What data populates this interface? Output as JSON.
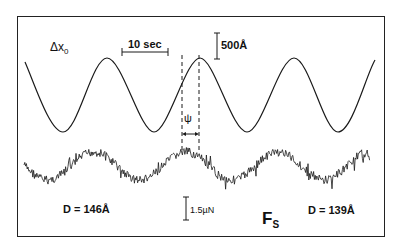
{
  "figure": {
    "top_trace_label": "Δx",
    "top_trace_label_sub": "0",
    "time_scale_label": "10 sec",
    "displacement_scale_label": "500Å",
    "phase_label": "ψ",
    "force_scale_label": "1.5µN",
    "bottom_trace_label": "F",
    "bottom_trace_label_sub": "S",
    "left_distance_label": "D = 146Å",
    "right_distance_label": "D = 139Å"
  },
  "colors": {
    "trace": "#1a1a1a",
    "frame": "#222222",
    "background": "#ffffff"
  },
  "chart_data": {
    "type": "line",
    "title": "",
    "series": [
      {
        "name": "Δx0 (drive displacement)",
        "shape": "sinusoid",
        "cycles_visible": 3.8,
        "period_seconds_approx": 13,
        "amplitude_scale": "500Å"
      },
      {
        "name": "Fs (measured force)",
        "shape": "noisy sinusoid, phase-lagged by ψ",
        "amplitude_scale": "1.5µN"
      }
    ],
    "annotations": [
      "10 sec",
      "500Å",
      "ψ",
      "1.5µN",
      "D = 146Å",
      "D = 139Å"
    ]
  }
}
